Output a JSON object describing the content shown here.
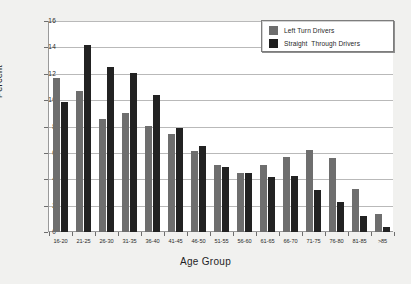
{
  "chart_data": {
    "type": "bar",
    "title": "",
    "subtitle": "",
    "xlabel": "Age Group",
    "ylabel": "Percent",
    "ylim": [
      0,
      16
    ],
    "yticks": [
      0,
      2,
      4,
      6,
      8,
      10,
      12,
      14,
      16
    ],
    "ytick_labels": [
      "0",
      "2",
      "4",
      "6",
      "8",
      "10",
      "12",
      "14",
      "16"
    ],
    "grid": "horizontal",
    "legend_position": "top-right",
    "categories": [
      "16-20",
      "21-25",
      "26-30",
      "31-35",
      "36-40",
      "41-45",
      "46-50",
      "51-55",
      "56-60",
      "61-65",
      "66-70",
      "71-75",
      "76-80",
      "81-85",
      ">85"
    ],
    "series": [
      {
        "name": "Left Turn Drivers",
        "color": "#6e6e6e",
        "values": [
          11.7,
          10.7,
          8.6,
          9.0,
          8.05,
          7.45,
          6.15,
          5.1,
          4.5,
          5.05,
          5.7,
          6.2,
          5.65,
          3.25,
          1.35
        ]
      },
      {
        "name": "Straight  Through Drivers",
        "color": "#222222",
        "values": [
          9.85,
          14.2,
          12.5,
          12.05,
          10.4,
          7.9,
          6.5,
          4.9,
          4.45,
          4.2,
          4.25,
          3.2,
          2.25,
          1.25,
          0.4
        ]
      }
    ]
  },
  "style": {
    "page_background": "#f1f1ef",
    "plot_background": "#ffffff",
    "grid_color": "#b9b9b9",
    "axis_color": "#9a9a9a",
    "text_color": "#1f1f1f"
  }
}
